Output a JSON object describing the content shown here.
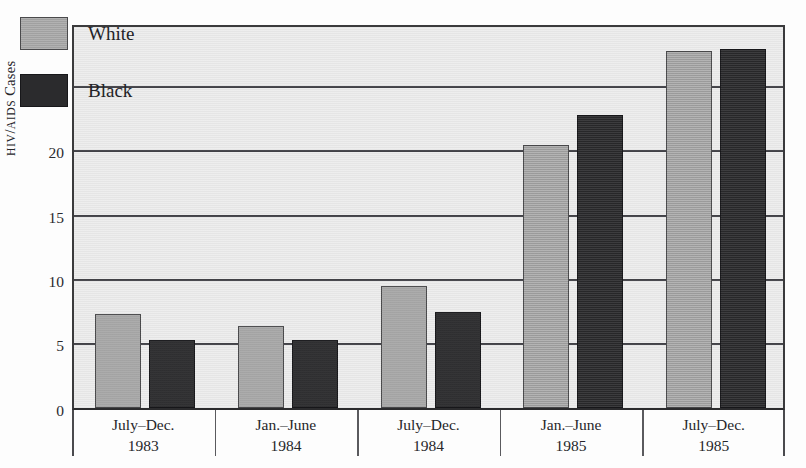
{
  "chart_data": {
    "type": "bar",
    "title": "",
    "subtitle": "",
    "xlabel": "",
    "ylabel": "HIV/AIDS Cases",
    "ylabel_parts": {
      "smallcaps_1": "HIV",
      "separator": "/",
      "smallcaps_2": "AIDS",
      "rest": " Cases"
    },
    "ylim": [
      0,
      30
    ],
    "yticks": [
      0,
      5,
      10,
      15,
      20,
      25,
      30
    ],
    "ytick_labels": [
      "0",
      "5",
      "10",
      "15",
      "20",
      "25",
      "30"
    ],
    "grid": true,
    "grid_orientation": "horizontal",
    "legend_position": "upper-left-inside",
    "categories": [
      "July–Dec. 1983",
      "Jan.–June 1984",
      "July–Dec. 1984",
      "Jan.–June 1985",
      "July–Dec. 1985"
    ],
    "category_lines": [
      {
        "line1": "July–Dec.",
        "line2": "1983"
      },
      {
        "line1": "Jan.–June",
        "line2": "1984"
      },
      {
        "line1": "July–Dec.",
        "line2": "1984"
      },
      {
        "line1": "Jan.–June",
        "line2": "1985"
      },
      {
        "line1": "July–Dec.",
        "line2": "1985"
      }
    ],
    "series": [
      {
        "name": "White",
        "color": "#a9a9a9",
        "values": [
          7.3,
          6.4,
          9.5,
          20.5,
          27.8
        ]
      },
      {
        "name": "Black",
        "color": "#2b2b2d",
        "values": [
          5.3,
          5.3,
          7.5,
          22.8,
          28.0
        ]
      }
    ]
  },
  "legend": {
    "items": [
      {
        "label": "White",
        "swatch": "white"
      },
      {
        "label": "Black",
        "swatch": "black"
      }
    ]
  },
  "colors": {
    "white_series": "#a9a9a9",
    "black_series": "#2b2b2d",
    "plot_background": "#ededed",
    "axis": "#3a3a3c",
    "gridline": "#44444a",
    "text": "#26262a",
    "page_background": "#ffffff"
  }
}
